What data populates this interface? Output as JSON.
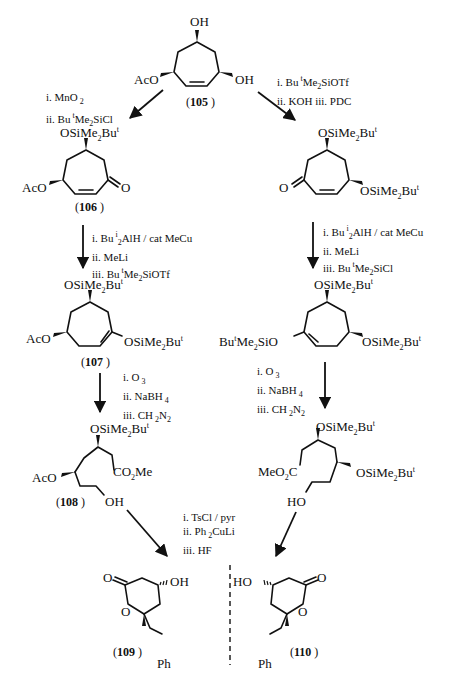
{
  "page": {
    "header_faint": "",
    "divider_style": "dashed"
  },
  "compounds": {
    "c105": {
      "number": "105",
      "substituents": {
        "top": "OH",
        "left": "AcO",
        "right": "OH"
      }
    },
    "c106": {
      "number": "106",
      "substituents": {
        "top": "OSiMe2Bu^t",
        "left": "AcO",
        "right": "O"
      }
    },
    "c107": {
      "number": "107",
      "substituents": {
        "top": "OSiMe2Bu^t",
        "left": "AcO",
        "right": "OSiMe2Bu^t"
      }
    },
    "c108": {
      "number": "108",
      "substituents": {
        "top": "OSiMe2Bu^t",
        "left": "AcO",
        "ester": "CO2Me",
        "end": "OH"
      }
    },
    "c109": {
      "number": "109",
      "substituents": {
        "carbonyl": "O",
        "ring_o": "O",
        "hydroxyl": "OH",
        "side": "Ph"
      }
    },
    "c110": {
      "number": "110",
      "substituents": {
        "carbonyl": "O",
        "ring_o": "O",
        "hydroxyl": "HO",
        "side": "Ph"
      }
    },
    "r_enone": {
      "top": "OSiMe2Bu^t",
      "left": "O",
      "right": "OSiMe2Bu^t"
    },
    "r_enol": {
      "top": "OSiMe2Bu^t",
      "left": "Bu^tMe2SiO",
      "right": "OSiMe2Bu^t"
    },
    "r_ester": {
      "top": "OSiMe2Bu^t",
      "ester": "MeO2C",
      "right": "OSiMe2Bu^t",
      "end": "HO"
    }
  },
  "labels": {
    "t_top": "OH",
    "t_aco": "AcO",
    "t_oh": "OH",
    "t_105": "105",
    "t106_top": "OSiMe",
    "t106_aco": "AcO",
    "t106_o": "O",
    "t106_num": "106",
    "t107_top": "OSiMe",
    "t107_aco": "AcO",
    "t107_right": "OSiMe",
    "t107_num": "107",
    "t108_top": "OSiMe",
    "t108_aco": "AcO",
    "t108_co2me": "CO",
    "t108_oh": "OH",
    "t108_num": "108",
    "rR1_top": "OSiMe",
    "rR1_o": "O",
    "rR1_right": "OSiMe",
    "rR2_top": "OSiMe",
    "rR2_left": "Bu",
    "rR2_right": "OSiMe",
    "rR3_top": "OSiMe",
    "rR3_meo2c": "MeO",
    "rR3_right": "OSiMe",
    "rR3_ho": "HO",
    "p109_o": "O",
    "p109_ro": "O",
    "p109_oh": "OH",
    "p109_ph": "Ph",
    "p109_num": "109",
    "p110_o": "O",
    "p110_ro": "O",
    "p110_ho": "HO",
    "p110_ph": "Ph",
    "p110_num": "110"
  },
  "conditions": {
    "left_1": [
      "i. MnO",
      "ii. Bu"
    ],
    "right_1": [
      "i. Bu",
      "ii. KOH  iii. PDC"
    ],
    "left_2": [
      "i. Bu",
      "ii. MeLi",
      "iii. Bu"
    ],
    "right_2": [
      "i. Bu",
      "ii. MeLi",
      "iii. Bu"
    ],
    "left_3": [
      "i. O",
      "ii. NaBH",
      "iii. CH"
    ],
    "right_3": [
      "i. O",
      "ii. NaBH",
      "iii. CH"
    ],
    "final": [
      "i. TsCl / pyr",
      "ii. Ph",
      "iii. HF"
    ]
  },
  "conditions_full": {
    "left_1": [
      "i. MnO2",
      "ii. Bu^tMe2SiCl"
    ],
    "right_1": [
      "i. Bu^tMe2SiOTf",
      "ii. KOH  iii. PDC"
    ],
    "left_2": [
      "i. Bu^i2AlH / cat MeCu",
      "ii. MeLi",
      "iii. Bu^tMe2SiOTf"
    ],
    "right_2": [
      "i. Bu^i2AlH / cat MeCu",
      "ii. MeLi",
      "iii. Bu^tMe2SiCl"
    ],
    "left_3": [
      "i. O3",
      "ii. NaBH4",
      "iii. CH2N2"
    ],
    "right_3": [
      "i. O3",
      "ii. NaBH4",
      "iii. CH2N2"
    ],
    "final": [
      "i. TsCl / pyr",
      "ii. Ph2CuLi",
      "iii. HF"
    ]
  }
}
